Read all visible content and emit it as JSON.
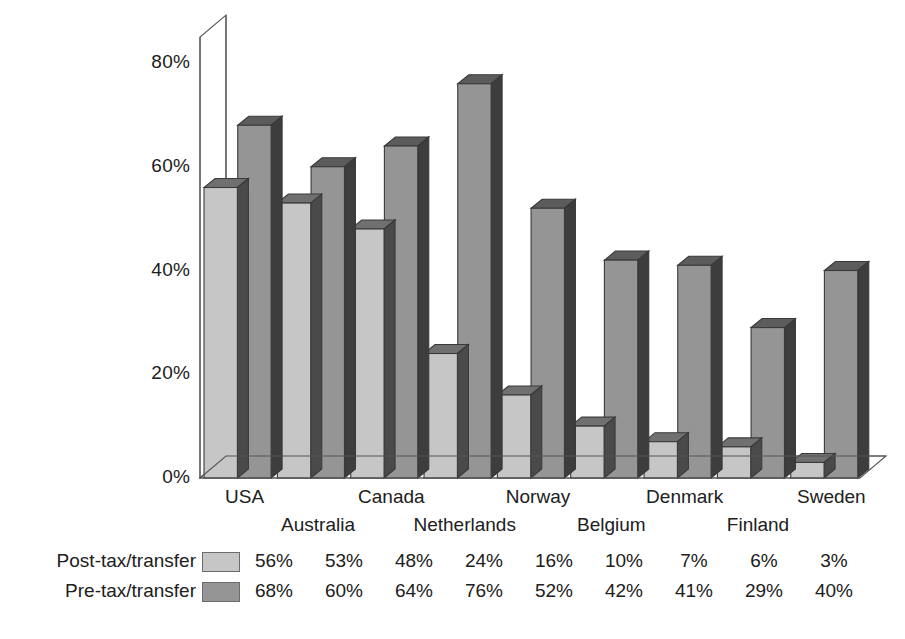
{
  "chart_data": {
    "type": "bar",
    "title": "",
    "subtitle": "",
    "xlabel": "",
    "ylabel": "",
    "ylim": [
      0,
      85
    ],
    "yticks": [
      "0%",
      "20%",
      "40%",
      "60%",
      "80%"
    ],
    "ytick_values": [
      0,
      20,
      40,
      60,
      80
    ],
    "grid": false,
    "legend_position": "bottom-left",
    "style": "3d-clustered-column",
    "categories": [
      "USA",
      "Australia",
      "Canada",
      "Netherlands",
      "Norway",
      "Belgium",
      "Denmark",
      "Finland",
      "Sweden"
    ],
    "series": [
      {
        "name": "Post-tax/transfer",
        "color": "#c6c6c6",
        "values": [
          56,
          53,
          48,
          24,
          16,
          10,
          7,
          6,
          3
        ],
        "labels": [
          "56%",
          "53%",
          "48%",
          "24%",
          "16%",
          "10%",
          "7%",
          "6%",
          "3%"
        ]
      },
      {
        "name": "Pre-tax/transfer",
        "color": "#959595",
        "values": [
          68,
          60,
          64,
          76,
          52,
          42,
          41,
          29,
          40
        ],
        "labels": [
          "68%",
          "60%",
          "64%",
          "76%",
          "52%",
          "42%",
          "41%",
          "29%",
          "40%"
        ]
      }
    ]
  },
  "colors": {
    "background": "#ffffff",
    "axis_line": "#555555",
    "bar_outline": "#3a3a3a",
    "post_tax_face": "#c6c6c6",
    "post_tax_side": "#4a4a4a",
    "post_tax_top": "#707070",
    "pre_tax_face": "#959595",
    "pre_tax_side": "#3d3d3d",
    "pre_tax_top": "#5c5c5c",
    "text": "#202020"
  }
}
